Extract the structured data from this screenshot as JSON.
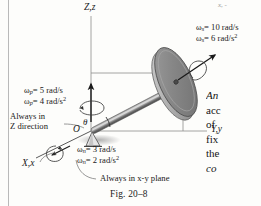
{
  "figure": {
    "caption": "Fig. 20–8",
    "axes": {
      "vertical": "Z,z",
      "horizontal": "Y,y",
      "oblique": "X,x",
      "angle_symbol": "θ"
    },
    "origin_label": "O",
    "spin": {
      "omega_symbol": "ω",
      "omega_subscript": "s",
      "omega_value": "= 10 rad/s",
      "alpha_symbol": "ω",
      "alpha_subscript": "s",
      "alpha_value": "= 6 rad/s",
      "alpha_exponent": "2"
    },
    "precession": {
      "omega_symbol": "ω",
      "omega_subscript": "p",
      "omega_value": "= 5 rad/s",
      "alpha_symbol": "ω",
      "alpha_subscript": "p",
      "alpha_value": "= 4 rad/s",
      "alpha_exponent": "2",
      "note_line1": "Always in",
      "note_line2": "Z direction"
    },
    "nutation": {
      "omega_symbol": "ω",
      "omega_subscript": "n",
      "omega_value": "= 3 rad/s",
      "alpha_symbol": "ω",
      "alpha_subscript": "n",
      "alpha_value": "= 2 rad/s",
      "alpha_exponent": "2",
      "note_prefix": "Always in ",
      "note_italic": "x-y",
      "note_suffix": " plane"
    },
    "colors": {
      "disk_face": "#8a8a8a",
      "disk_rim": "#b5b5b5",
      "rod": "#6f6f6f",
      "axis_line": "#8e8e8e",
      "ink": "#1a1a1a"
    }
  },
  "body_text": {
    "top_cut": "x, -",
    "lines": [
      "An",
      "acc",
      "of",
      "fix",
      "the",
      "co"
    ]
  }
}
